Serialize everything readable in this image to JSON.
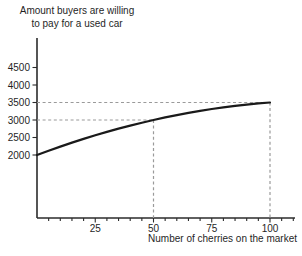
{
  "title": {
    "line1": "Amount buyers are willing",
    "line2": "to pay for a used car"
  },
  "chart_data": {
    "type": "line",
    "title": "Amount buyers are willing to pay for a used car",
    "xlabel": "Number of cherries on the market",
    "ylabel": "Amount buyers are willing to pay for a used car",
    "x": [
      0,
      5,
      10,
      15,
      20,
      25,
      30,
      35,
      40,
      45,
      50,
      55,
      60,
      65,
      70,
      75,
      80,
      85,
      90,
      95,
      100
    ],
    "values": [
      2000,
      2123,
      2240,
      2353,
      2460,
      2563,
      2660,
      2753,
      2840,
      2923,
      3000,
      3073,
      3140,
      3203,
      3260,
      3313,
      3360,
      3403,
      3440,
      3473,
      3500
    ],
    "y_ticks": [
      2000,
      2500,
      3000,
      3500,
      4000,
      4500
    ],
    "x_ticks": [
      25,
      50,
      75,
      100
    ],
    "x_minor_tick_step": 5,
    "xlim": [
      0,
      110
    ],
    "ylim": [
      2000,
      4500
    ],
    "grid": "off",
    "legend": "none",
    "guides": [
      {
        "type": "h",
        "y": 3500,
        "x_from": 0,
        "x_to": 100
      },
      {
        "type": "h",
        "y": 3000,
        "x_from": 0,
        "x_to": 50
      },
      {
        "type": "v",
        "x": 50,
        "y_to": 3000
      },
      {
        "type": "v",
        "x": 100,
        "y_to": 3500
      }
    ],
    "key_points": [
      {
        "x": 0,
        "y": 2000
      },
      {
        "x": 50,
        "y": 3000
      },
      {
        "x": 100,
        "y": 3500
      }
    ],
    "colors": {
      "curve": "#1a1a1a",
      "guide": "#9a9a9a",
      "axis": "#2b2b2b",
      "text": "#1f1f1f",
      "background": "#ffffff"
    }
  }
}
